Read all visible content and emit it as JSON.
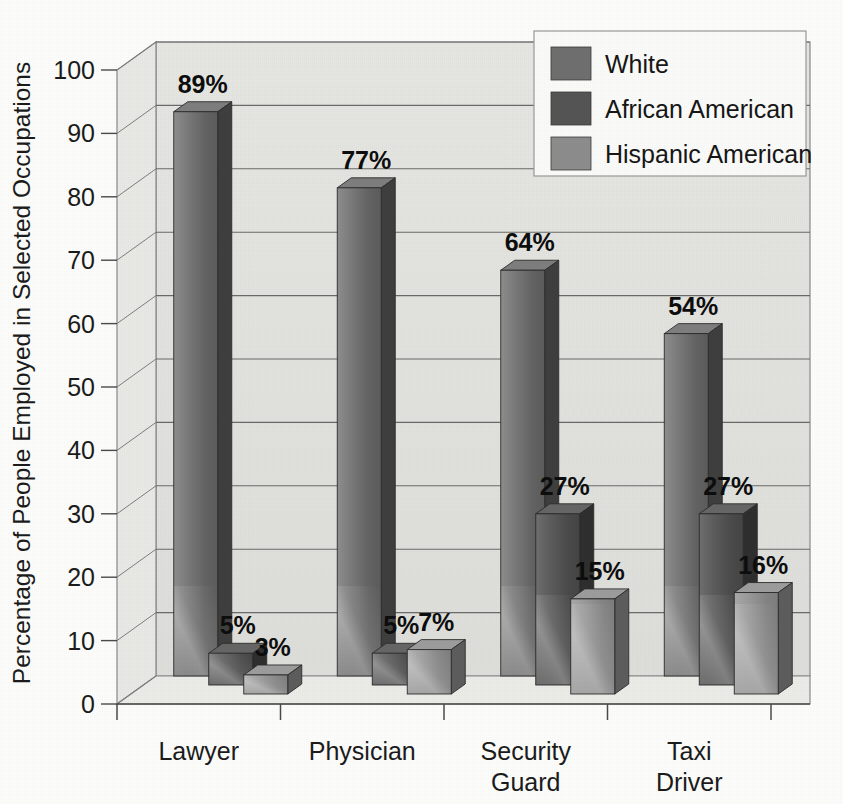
{
  "chart_data": {
    "type": "bar",
    "title": "",
    "subtitle": "",
    "xlabel": "",
    "ylabel": "Percentage of People Employed in Selected Occupations",
    "categories": [
      "Lawyer",
      "Physician",
      "Security\nGuard",
      "Taxi\nDriver"
    ],
    "category_lines": [
      [
        "Lawyer"
      ],
      [
        "Physician"
      ],
      [
        "Security",
        "Guard"
      ],
      [
        "Taxi",
        "Driver"
      ]
    ],
    "series": [
      {
        "name": "White",
        "values": [
          89,
          77,
          64,
          54
        ],
        "color": "#6f6f6f"
      },
      {
        "name": "African American",
        "values": [
          5,
          5,
          27,
          27
        ],
        "color": "#555555"
      },
      {
        "name": "Hispanic American",
        "values": [
          3,
          7,
          15,
          16
        ],
        "color": "#8d8d8d"
      }
    ],
    "value_labels": [
      [
        "89%",
        "5%",
        "3%"
      ],
      [
        "77%",
        "5%",
        "7%"
      ],
      [
        "64%",
        "27%",
        "15%"
      ],
      [
        "54%",
        "27%",
        "16%"
      ]
    ],
    "ylim": [
      0,
      100
    ],
    "yticks": [
      0,
      10,
      20,
      30,
      40,
      50,
      60,
      70,
      80,
      90,
      100
    ],
    "ytick_labels": [
      "0",
      "10",
      "20",
      "30",
      "40",
      "50",
      "60",
      "70",
      "80",
      "90",
      "100"
    ],
    "grid": true,
    "grid_axis": "y",
    "legend_position": "top-right",
    "three_d": true
  },
  "legend": {
    "items": [
      {
        "label": "White",
        "swatch": "#6f6f6f"
      },
      {
        "label": "African American",
        "swatch": "#555555"
      },
      {
        "label": "Hispanic American",
        "swatch": "#8d8d8d"
      }
    ]
  },
  "colors": {
    "page_background": "#fdfdfb",
    "plot_wall": "#e3e3df",
    "plot_floor": "#ebebe7",
    "grid_line": "#6a6a6a",
    "axis_line": "#4a4a4a",
    "legend_background": "#fbfbf9",
    "text": "#1b1b1b"
  }
}
